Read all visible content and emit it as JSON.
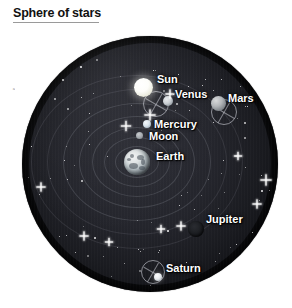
{
  "title": {
    "text": "Sphere of stars"
  },
  "edge_caption": {
    "text": "a"
  },
  "diagram": {
    "model_name": "geocentric-ptolemaic-model",
    "sphere": {
      "center_x": 150,
      "center_y": 164,
      "radius": 128,
      "fill_color": "#16171c",
      "rim_color": "#000000"
    },
    "label_color": "#ffffff",
    "orbit_color": "#b0b2bc",
    "epicycle_color": "#e2e4ec"
  },
  "bodies": [
    {
      "name": "Sun",
      "label": "Sun",
      "cx": 143,
      "cy": 87,
      "r": 9.5,
      "color": "#fdfdfa",
      "label_x": 157,
      "label_y": 73,
      "label_size": "lg",
      "has_epicycle": true,
      "epicycle_cx": 156,
      "epicycle_cy": 104,
      "epicycle_r": 13
    },
    {
      "name": "Venus",
      "label": "Venus",
      "cx": 168,
      "cy": 101,
      "r": 5,
      "color": "#c9ced2",
      "label_x": 175,
      "label_y": 88,
      "label_size": "lg",
      "has_epicycle": false
    },
    {
      "name": "Mercury",
      "label": "Mercury",
      "cx": 147,
      "cy": 124,
      "r": 4,
      "color": "#d7e2ea",
      "label_x": 154,
      "label_y": 118,
      "label_size": "lg",
      "has_epicycle": false
    },
    {
      "name": "Moon",
      "label": "Moon",
      "cx": 139,
      "cy": 135,
      "r": 3.5,
      "color": "#a3a8ad",
      "label_x": 149,
      "label_y": 130,
      "label_size": "lg",
      "has_epicycle": false
    },
    {
      "name": "Earth",
      "label": "Earth",
      "cx": 137,
      "cy": 162,
      "r": 13,
      "color": "#c2cace",
      "label_x": 156,
      "label_y": 150,
      "label_size": "lg",
      "has_epicycle": false
    },
    {
      "name": "Mars",
      "label": "Mars",
      "cx": 218,
      "cy": 103,
      "r": 7.5,
      "color": "#b3b6b9",
      "label_x": 228,
      "label_y": 92,
      "label_size": "lg",
      "has_epicycle": true,
      "epicycle_cx": 224,
      "epicycle_cy": 112,
      "epicycle_r": 13
    },
    {
      "name": "Jupiter",
      "label": "Jupiter",
      "cx": 196,
      "cy": 229,
      "r": 8,
      "color": "#1e2024",
      "label_x": 206,
      "label_y": 213,
      "label_size": "lg",
      "has_epicycle": false
    },
    {
      "name": "Saturn",
      "label": "Saturn",
      "cx": 158,
      "cy": 277,
      "r": 4,
      "color": "#e9ecef",
      "label_x": 166,
      "label_y": 262,
      "label_size": "lg",
      "has_epicycle": true,
      "epicycle_cx": 153,
      "epicycle_cy": 272,
      "epicycle_r": 12
    }
  ],
  "orbits": [
    {
      "name": "moon-deferent",
      "rx": 22,
      "ry": 16
    },
    {
      "name": "mercury-deferent",
      "rx": 33,
      "ry": 25
    },
    {
      "name": "venus-deferent",
      "rx": 45,
      "ry": 35
    },
    {
      "name": "sun-deferent",
      "rx": 58,
      "ry": 46
    },
    {
      "name": "mars-deferent",
      "rx": 74,
      "ry": 59
    },
    {
      "name": "jupiter-deferent",
      "rx": 90,
      "ry": 73
    },
    {
      "name": "saturn-deferent",
      "rx": 106,
      "ry": 87
    }
  ],
  "stars": {
    "count": 120,
    "color": "#ffffff"
  }
}
